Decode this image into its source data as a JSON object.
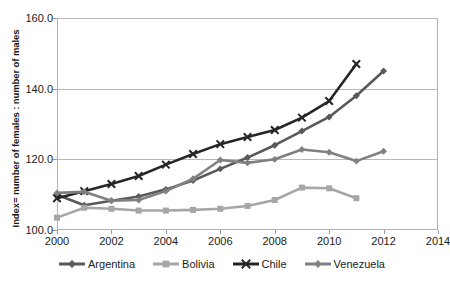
{
  "chart_data": {
    "type": "line",
    "title": "",
    "xlabel": "",
    "ylabel": "Index= number of females : number of males",
    "xlim": [
      2000,
      2014
    ],
    "ylim": [
      100.0,
      160.0
    ],
    "yticks": [
      "160.0",
      "140.0",
      "120.0",
      "100.0"
    ],
    "ytick_values": [
      160.0,
      140.0,
      120.0,
      100.0
    ],
    "xticks": [
      "2000",
      "2002",
      "2004",
      "2006",
      "2008",
      "2010",
      "2012",
      "2014"
    ],
    "xtick_values": [
      2000,
      2002,
      2004,
      2006,
      2008,
      2010,
      2012,
      2014
    ],
    "grid": true,
    "legend_position": "bottom",
    "series": [
      {
        "name": "Argentina",
        "color": "#595959",
        "marker": "diamond",
        "x": [
          2000,
          2001,
          2002,
          2003,
          2004,
          2005,
          2006,
          2007,
          2008,
          2009,
          2010,
          2011,
          2012
        ],
        "values": [
          110.0,
          107.0,
          108.3,
          109.5,
          111.5,
          114.0,
          117.3,
          120.5,
          124.0,
          128.0,
          132.0,
          138.0,
          145.0
        ]
      },
      {
        "name": "Bolivia",
        "color": "#a6a6a6",
        "marker": "square",
        "x": [
          2000,
          2001,
          2002,
          2003,
          2004,
          2005,
          2006,
          2007,
          2008,
          2009,
          2010,
          2011
        ],
        "values": [
          103.5,
          106.3,
          106.0,
          105.5,
          105.5,
          105.7,
          106.0,
          106.8,
          108.5,
          112.0,
          111.8,
          109.0
        ]
      },
      {
        "name": "Chile",
        "color": "#262626",
        "marker": "x",
        "x": [
          2000,
          2001,
          2002,
          2003,
          2004,
          2005,
          2006,
          2007,
          2008,
          2009,
          2010,
          2011
        ],
        "values": [
          109.0,
          111.0,
          113.0,
          115.3,
          118.5,
          121.5,
          124.3,
          126.3,
          128.3,
          131.8,
          136.5,
          147.0
        ]
      },
      {
        "name": "Venezuela",
        "color": "#808080",
        "marker": "diamond",
        "x": [
          2000,
          2001,
          2002,
          2003,
          2004,
          2005,
          2006,
          2007,
          2008,
          2009,
          2010,
          2011,
          2012
        ],
        "values": [
          110.5,
          110.8,
          108.3,
          108.5,
          111.0,
          114.5,
          119.8,
          119.0,
          120.0,
          122.8,
          122.0,
          119.5,
          122.3
        ]
      }
    ]
  }
}
